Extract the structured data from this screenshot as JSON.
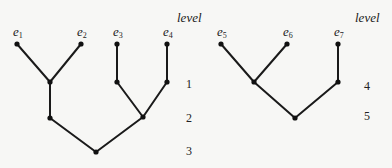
{
  "diagram": {
    "type": "merge-trees",
    "level_header": "level",
    "trees": [
      {
        "name": "left-tree",
        "leaves": [
          {
            "id": "e1",
            "base": "e",
            "sub": "1",
            "x": 17,
            "y": 44
          },
          {
            "id": "e2",
            "base": "e",
            "sub": "2",
            "x": 81,
            "y": 44
          },
          {
            "id": "e3",
            "base": "e",
            "sub": "3",
            "x": 117,
            "y": 44
          },
          {
            "id": "e4",
            "base": "e",
            "sub": "4",
            "x": 167,
            "y": 44
          }
        ],
        "internal_nodes": [
          {
            "id": "n12",
            "level": 1,
            "x": 50,
            "y": 82
          },
          {
            "id": "n3",
            "level": 1,
            "x": 117,
            "y": 82
          },
          {
            "id": "n4",
            "level": 1,
            "x": 167,
            "y": 82
          },
          {
            "id": "m12",
            "level": 2,
            "x": 50,
            "y": 118
          },
          {
            "id": "m34",
            "level": 2,
            "x": 143,
            "y": 117
          },
          {
            "id": "root-left",
            "level": 3,
            "x": 96,
            "y": 152
          }
        ],
        "edges": [
          [
            "e1",
            "n12"
          ],
          [
            "e2",
            "n12"
          ],
          [
            "e3",
            "n3"
          ],
          [
            "e4",
            "n4"
          ],
          [
            "n12",
            "m12"
          ],
          [
            "n3",
            "m34"
          ],
          [
            "n4",
            "m34"
          ],
          [
            "m12",
            "root-left"
          ],
          [
            "m34",
            "root-left"
          ]
        ],
        "levels": [
          {
            "label": "1",
            "y": 84
          },
          {
            "label": "2",
            "y": 118
          },
          {
            "label": "3",
            "y": 151
          }
        ],
        "level_header_pos": {
          "x": 177,
          "y": 22
        },
        "level_num_x": 186
      },
      {
        "name": "right-tree",
        "leaves": [
          {
            "id": "e5",
            "base": "e",
            "sub": "5",
            "x": 221,
            "y": 44
          },
          {
            "id": "e6",
            "base": "e",
            "sub": "6",
            "x": 287,
            "y": 44
          },
          {
            "id": "e7",
            "base": "e",
            "sub": "7",
            "x": 338,
            "y": 44
          }
        ],
        "internal_nodes": [
          {
            "id": "n56",
            "level": 4,
            "x": 254,
            "y": 82
          },
          {
            "id": "n7",
            "level": 4,
            "x": 338,
            "y": 82
          },
          {
            "id": "root-right",
            "level": 5,
            "x": 295,
            "y": 118
          }
        ],
        "edges": [
          [
            "e5",
            "n56"
          ],
          [
            "e6",
            "n56"
          ],
          [
            "e7",
            "n7"
          ],
          [
            "n56",
            "root-right"
          ],
          [
            "n7",
            "root-right"
          ]
        ],
        "levels": [
          {
            "label": "4",
            "y": 86
          },
          {
            "label": "5",
            "y": 116
          }
        ],
        "level_header_pos": {
          "x": 355,
          "y": 22
        },
        "level_num_x": 364
      }
    ]
  }
}
